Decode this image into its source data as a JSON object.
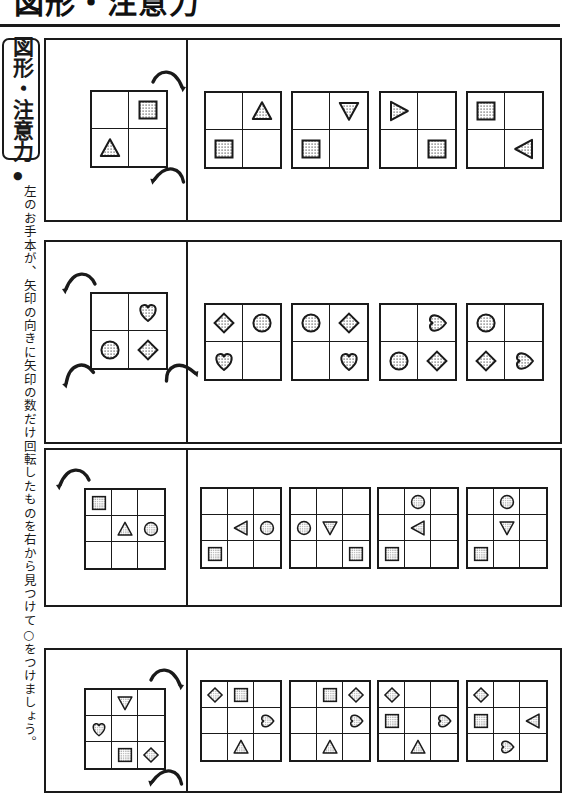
{
  "header": {
    "title": "図形・注意力",
    "title_number": "1"
  },
  "rail": {
    "badge_label": "図形・注意力",
    "bullet": "●",
    "instruction": "左のお手本が、矢印の向きに矢印の数だけ回転したものを右から見つけて○をつけましょう。"
  },
  "shapes_legend": {
    "square": "dotted-square",
    "triangle_up": "dotted-triangle-up",
    "triangle_down": "dotted-triangle-down",
    "triangle_left": "dotted-triangle-left",
    "triangle_right": "dotted-triangle-right",
    "circle": "dotted-circle",
    "heart_up": "dotted-heart-up",
    "heart_left": "dotted-heart-left",
    "heart_right": "dotted-heart-right",
    "diamond": "dotted-diamond"
  },
  "colors": {
    "ink": "#1a1a1a",
    "paper": "#ffffff",
    "dot_fill": "#9a9a9a"
  },
  "problems": [
    {
      "index": 1,
      "grid_size": 2,
      "arrow_count": 2,
      "arrow_direction": "clockwise",
      "example": {
        "cells": [
          [
            "",
            "square"
          ],
          [
            "triangle_up",
            ""
          ]
        ]
      },
      "options": [
        {
          "label": "A",
          "cells": [
            [
              "",
              "triangle_up"
            ],
            [
              "square",
              ""
            ]
          ]
        },
        {
          "label": "B",
          "cells": [
            [
              "",
              "triangle_down"
            ],
            [
              "square",
              ""
            ]
          ]
        },
        {
          "label": "C",
          "cells": [
            [
              "triangle_right",
              ""
            ],
            [
              "",
              "square"
            ]
          ]
        },
        {
          "label": "D",
          "cells": [
            [
              "square",
              ""
            ],
            [
              "",
              "triangle_left"
            ]
          ]
        }
      ]
    },
    {
      "index": 2,
      "grid_size": 2,
      "arrow_count": 3,
      "arrow_direction": "counterclockwise",
      "example": {
        "cells": [
          [
            "",
            "heart_up"
          ],
          [
            "circle",
            "diamond"
          ]
        ]
      },
      "options": [
        {
          "label": "A",
          "cells": [
            [
              "diamond",
              "circle"
            ],
            [
              "heart_up",
              ""
            ]
          ]
        },
        {
          "label": "B",
          "cells": [
            [
              "circle",
              "diamond"
            ],
            [
              "",
              "heart_up"
            ]
          ]
        },
        {
          "label": "C",
          "cells": [
            [
              "",
              "heart_right"
            ],
            [
              "circle",
              "diamond"
            ]
          ]
        },
        {
          "label": "D",
          "cells": [
            [
              "circle",
              ""
            ],
            [
              "diamond",
              "heart_right"
            ]
          ]
        }
      ]
    },
    {
      "index": 3,
      "grid_size": 3,
      "arrow_count": 1,
      "arrow_direction": "counterclockwise",
      "example": {
        "cells": [
          [
            "square",
            "",
            ""
          ],
          [
            "",
            "triangle_up",
            "circle"
          ],
          [
            "",
            "",
            ""
          ]
        ]
      },
      "options": [
        {
          "label": "A",
          "cells": [
            [
              "",
              "",
              ""
            ],
            [
              "",
              "triangle_left",
              "circle"
            ],
            [
              "square",
              "",
              ""
            ]
          ]
        },
        {
          "label": "B",
          "cells": [
            [
              "",
              "",
              ""
            ],
            [
              "circle",
              "triangle_down",
              ""
            ],
            [
              "",
              "",
              "square"
            ]
          ]
        },
        {
          "label": "C",
          "cells": [
            [
              "",
              "circle",
              ""
            ],
            [
              "",
              "triangle_left",
              ""
            ],
            [
              "square",
              "",
              ""
            ]
          ]
        },
        {
          "label": "D",
          "cells": [
            [
              "",
              "circle",
              ""
            ],
            [
              "",
              "triangle_down",
              ""
            ],
            [
              "square",
              "",
              ""
            ]
          ]
        }
      ]
    },
    {
      "index": 4,
      "grid_size": 3,
      "arrow_count": 2,
      "arrow_direction": "clockwise",
      "example": {
        "cells": [
          [
            "",
            "triangle_down",
            ""
          ],
          [
            "heart_up",
            "",
            ""
          ],
          [
            "",
            "square",
            "diamond"
          ]
        ]
      },
      "options": [
        {
          "label": "A",
          "cells": [
            [
              "diamond",
              "square",
              ""
            ],
            [
              "",
              "",
              "heart_right"
            ],
            [
              "",
              "triangle_up",
              ""
            ]
          ]
        },
        {
          "label": "B",
          "cells": [
            [
              "",
              "square",
              "diamond"
            ],
            [
              "",
              "",
              "heart_right"
            ],
            [
              "",
              "triangle_up",
              ""
            ]
          ]
        },
        {
          "label": "C",
          "cells": [
            [
              "diamond",
              "",
              ""
            ],
            [
              "square",
              "",
              "heart_right"
            ],
            [
              "",
              "triangle_up",
              ""
            ]
          ]
        },
        {
          "label": "D",
          "cells": [
            [
              "diamond",
              "",
              ""
            ],
            [
              "square",
              "",
              "triangle_left"
            ],
            [
              "",
              "heart_right",
              ""
            ]
          ]
        }
      ]
    }
  ],
  "layout": {
    "panels": [
      {
        "top": 38,
        "height": 180,
        "ex_width": 140,
        "grid_px": 74,
        "grid_left": 44,
        "grid_top": 50
      },
      {
        "top": 240,
        "height": 200,
        "ex_width": 140,
        "grid_px": 74,
        "grid_left": 44,
        "grid_top": 50
      },
      {
        "top": 448,
        "height": 155,
        "ex_width": 140,
        "grid_px": 78,
        "grid_left": 38,
        "grid_top": 38
      },
      {
        "top": 648,
        "height": 141,
        "ex_width": 140,
        "grid_px": 78,
        "grid_left": 38,
        "grid_top": 38
      }
    ]
  }
}
